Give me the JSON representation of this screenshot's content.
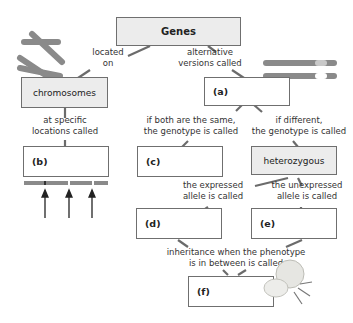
{
  "diagram": {
    "nodes": {
      "genes": "Genes",
      "chromosomes": "chromosomes",
      "a": "(a)",
      "b": "(b)",
      "c": "(c)",
      "heterozygous": "heterozygous",
      "d": "(d)",
      "e": "(e)",
      "f": "(f)"
    },
    "edges": {
      "located_on": [
        "located",
        "on"
      ],
      "alternative_versions": [
        "alternative",
        "versions called"
      ],
      "specific_locations": [
        "at specific",
        "locations called"
      ],
      "same_genotype": [
        "if both are the same,",
        "the genotype is called"
      ],
      "different_genotype": [
        "if different,",
        "the genotype is called"
      ],
      "expressed": [
        "the expressed",
        "allele is called"
      ],
      "unexpressed": [
        "the unexpressed",
        "allele is called"
      ],
      "in_between": [
        "inheritance when the phenotype",
        "is in between is called"
      ]
    },
    "illustrations": [
      "chromosome-pair",
      "homologous-chromosomes",
      "chromosome-with-loci",
      "locus-arrows",
      "flower"
    ],
    "colors": {
      "box_border": "#6f6f6f",
      "filled_box": "#ececec",
      "connector": "#6b6b6b",
      "chromosome": "#8a8a8a"
    }
  }
}
